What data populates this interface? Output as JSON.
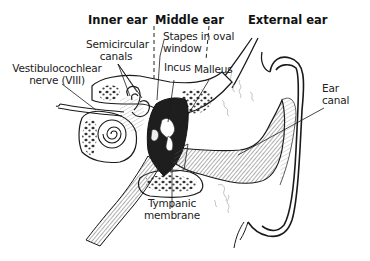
{
  "diagram": {
    "section_headers": [
      {
        "id": "inner",
        "label": "Inner ear"
      },
      {
        "id": "middle",
        "label": "Middle ear"
      },
      {
        "id": "external",
        "label": "External ear"
      }
    ],
    "labels": {
      "semicircular_canals": [
        "Semicircular",
        "canals"
      ],
      "vestibulocochlear_nerve": [
        "Vestibulocochlear",
        "nerve (VIII)"
      ],
      "stapes": [
        "Stapes in oval",
        "window"
      ],
      "incus": "Incus",
      "malleus": "Malleus",
      "ear_canal": [
        "Ear",
        "canal"
      ],
      "tympanic_membrane": [
        "Tympanic",
        "membrane"
      ]
    },
    "colors": {
      "ink": "#1a1a1a",
      "background": "#ffffff",
      "shading": "#555555"
    }
  }
}
